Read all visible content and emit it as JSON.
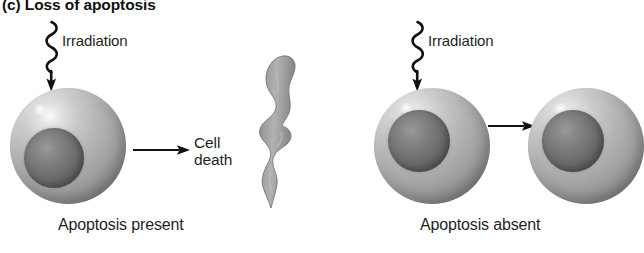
{
  "figure": {
    "title": "(c) Loss of apoptosis",
    "background_color": "#ffffff",
    "ink_color": "#1a1a1a"
  },
  "panels": [
    {
      "id": "apoptosis-present",
      "caption": "Apoptosis present",
      "stimulus_label": "Irradiation",
      "outcome_label": "Cell death",
      "stimulus_icon": "wavy-irradiation-arrow-icon",
      "flow_icon": "right-arrow-icon",
      "cells": [
        {
          "name": "intact-cell",
          "state": "intact"
        }
      ],
      "apoptotic_body": {
        "name": "apoptotic-body",
        "state": "fragmented",
        "fill_color": "#9b9b9b"
      }
    },
    {
      "id": "apoptosis-absent",
      "caption": "Apoptosis absent",
      "stimulus_label": "Irradiation",
      "stimulus_icon": "wavy-irradiation-arrow-icon",
      "flow_icon": "right-arrow-icon",
      "cells": [
        {
          "name": "irradiated-cell",
          "state": "intact"
        },
        {
          "name": "surviving-cell",
          "state": "intact"
        }
      ]
    }
  ]
}
